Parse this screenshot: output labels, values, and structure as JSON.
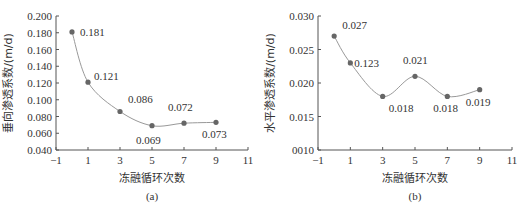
{
  "chart_data": [
    {
      "type": "line",
      "panel": "(a)",
      "title": "",
      "xlabel": "冻融循环次数",
      "ylabel": "垂向渗透系数/(m/d)",
      "x": [
        0,
        1,
        3,
        5,
        7,
        9
      ],
      "values": [
        0.181,
        0.121,
        0.086,
        0.069,
        0.072,
        0.073
      ],
      "data_labels": [
        "0.181",
        "0.121",
        "0.086",
        "0.069",
        "0.072",
        "0.073"
      ],
      "xlim": [
        -1,
        11
      ],
      "ylim": [
        0.04,
        0.2
      ],
      "x_ticks": [
        "-1",
        "1",
        "3",
        "5",
        "7",
        "9",
        "11"
      ],
      "y_ticks": [
        "0.200",
        "0.180",
        "0.160",
        "0.140",
        "0.120",
        "0.100",
        "0.080",
        "0.060",
        "0.040"
      ],
      "grid": false,
      "legend": null,
      "line_color": "#999999",
      "marker_color": "#666666",
      "smooth": true
    },
    {
      "type": "line",
      "panel": "(b)",
      "title": "",
      "xlabel": "冻融循环次数",
      "ylabel": "水平渗透系数/(m/d)",
      "x": [
        0,
        1,
        3,
        5,
        7,
        9
      ],
      "values": [
        0.027,
        0.023,
        0.018,
        0.021,
        0.018,
        0.019
      ],
      "data_labels": [
        "0.027",
        "0.123",
        "0.018",
        "0.021",
        "0.018",
        "0.019"
      ],
      "xlim": [
        -1,
        11
      ],
      "ylim": [
        0.01,
        0.03
      ],
      "x_ticks": [
        "-1",
        "1",
        "3",
        "5",
        "7",
        "9",
        "11"
      ],
      "y_ticks": [
        "0.030",
        "0.025",
        "0.020",
        "0.015",
        "0010"
      ],
      "grid": false,
      "legend": null,
      "line_color": "#999999",
      "marker_color": "#666666",
      "smooth": true
    }
  ]
}
